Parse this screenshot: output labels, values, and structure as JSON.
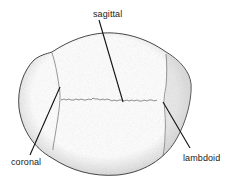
{
  "diagram": {
    "labels": {
      "sagittal": "sagittal",
      "coronal": "coronal",
      "lambdoid": "lambdoid"
    },
    "colors": {
      "outline": "#222222",
      "leader": "#111111",
      "shading": "#9a9a9a",
      "text": "#1a1a1a"
    }
  }
}
